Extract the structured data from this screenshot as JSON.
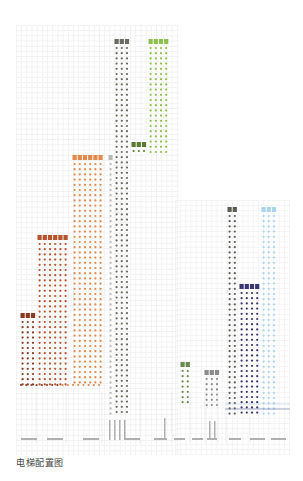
{
  "title": "电梯配置图",
  "colors": {
    "grid": "#f1f1f1",
    "zone_low_1": "#8b3a22",
    "zone_low_2": "#b5532c",
    "zone_mid": "#e0894a",
    "zone_shuttle_grey": "#6b6b60",
    "zone_high_green": "#8cc04a",
    "zone_dark_green": "#5a7a30",
    "zone_navy": "#3a3670",
    "zone_light_blue": "#a9d6ea",
    "zone_grey_col": "#b8b8b8"
  },
  "groups": [
    {
      "id": "low-1",
      "color": "#8b3a22",
      "x": 21,
      "cabs": 3,
      "top": 316,
      "bottom": 385
    },
    {
      "id": "low-2",
      "color": "#b5532c",
      "x": 38,
      "cabs": 6,
      "top": 238,
      "bottom": 385
    },
    {
      "id": "mid",
      "color": "#e0894a",
      "x": 73,
      "cabs": 6,
      "top": 158,
      "bottom": 385
    },
    {
      "id": "grey-column",
      "color": "#b8b8b8",
      "x": 109,
      "cabs": 1,
      "top": 158,
      "bottom": 415
    },
    {
      "id": "shuttle",
      "color": "#6b6b60",
      "x": 115,
      "cabs": 3,
      "top": 42,
      "bottom": 415
    },
    {
      "id": "dark-green",
      "color": "#5a7a30",
      "x": 132,
      "cabs": 3,
      "top": 145,
      "bottom": 155
    },
    {
      "id": "high-green",
      "color": "#8cc04a",
      "x": 149,
      "cabs": 4,
      "top": 42,
      "bottom": 155
    },
    {
      "id": "small-green",
      "color": "#6a8a50",
      "x": 181,
      "cabs": 2,
      "top": 365,
      "bottom": 405
    },
    {
      "id": "service",
      "color": "#8a8a8a",
      "x": 205,
      "cabs": 3,
      "top": 373,
      "bottom": 405
    },
    {
      "id": "tower-grey",
      "color": "#5c5c55",
      "x": 228,
      "cabs": 2,
      "top": 210,
      "bottom": 415
    },
    {
      "id": "navy",
      "color": "#3a3670",
      "x": 240,
      "cabs": 4,
      "top": 287,
      "bottom": 415
    },
    {
      "id": "light-blue",
      "color": "#a9d6ea",
      "x": 262,
      "cabs": 3,
      "top": 210,
      "bottom": 415
    }
  ]
}
